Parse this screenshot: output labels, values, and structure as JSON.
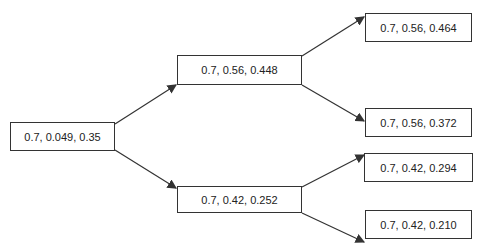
{
  "diagram": {
    "type": "tree",
    "nodes": {
      "root": {
        "label": "0.7, 0.049, 0.35"
      },
      "mid_top": {
        "label": "0.7, 0.56, 0.448"
      },
      "mid_bottom": {
        "label": "0.7, 0.42, 0.252"
      },
      "leaf_1": {
        "label": "0.7, 0.56, 0.464"
      },
      "leaf_2": {
        "label": "0.7, 0.56, 0.372"
      },
      "leaf_3": {
        "label": "0.7, 0.42, 0.294"
      },
      "leaf_4": {
        "label": "0.7, 0.42, 0.210"
      }
    },
    "edges": [
      [
        "root",
        "mid_top"
      ],
      [
        "root",
        "mid_bottom"
      ],
      [
        "mid_top",
        "leaf_1"
      ],
      [
        "mid_top",
        "leaf_2"
      ],
      [
        "mid_bottom",
        "leaf_3"
      ],
      [
        "mid_bottom",
        "leaf_4"
      ]
    ],
    "colors": {
      "line": "#333333",
      "box_border": "#333333",
      "background": "#ffffff"
    }
  }
}
